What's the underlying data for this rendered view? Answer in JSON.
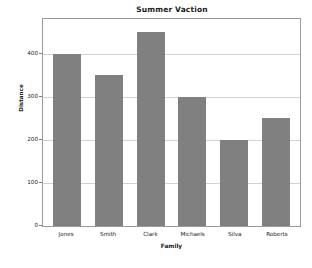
{
  "chart_data": {
    "type": "bar",
    "title": "Summer Vaction",
    "xlabel": "Family",
    "ylabel": "Distance",
    "categories": [
      "Jones",
      "Smith",
      "Clark",
      "Michaels",
      "Silva",
      "Roberts"
    ],
    "values": [
      400,
      350,
      450,
      300,
      200,
      250
    ],
    "yticks": [
      0,
      100,
      200,
      300,
      400
    ],
    "ytick_labels": [
      "0",
      "100",
      "200",
      "300",
      "400"
    ],
    "ylim": [
      0,
      480
    ],
    "grid": true,
    "grid_axis": "y",
    "legend": false,
    "legend_position": "none",
    "bar_color": "#808080",
    "grid_color": "#d2d2d2",
    "axes_border_color": "#9a9a9a",
    "background_color": "#ffffff",
    "text_color": "#1a1a1a"
  }
}
